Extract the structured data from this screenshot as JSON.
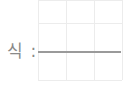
{
  "worksheet": {
    "label": "식 :",
    "answer_value": "",
    "grid": {
      "columns": 3,
      "rows": 3
    }
  }
}
